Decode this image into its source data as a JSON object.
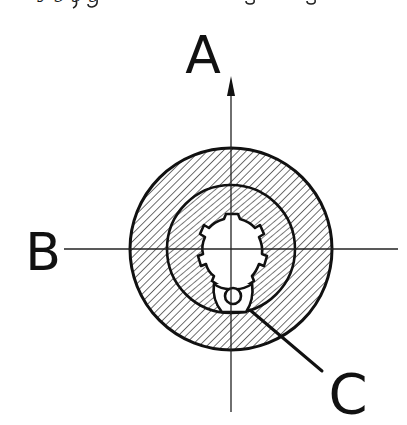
{
  "diagram": {
    "type": "mechanical-cross-section",
    "top_caption_fragment": "y  g                 g g",
    "labels": {
      "a": "A",
      "b": "B",
      "c": "C"
    },
    "axes": {
      "vertical": {
        "label": "A",
        "direction": "up",
        "has_arrow": true
      },
      "horizontal": {
        "label": "B"
      }
    },
    "parts": [
      {
        "name": "outer-ring",
        "hatched": true
      },
      {
        "name": "inner-hub",
        "hatched": true
      },
      {
        "name": "splined-bore",
        "hatched": false
      },
      {
        "name": "pin",
        "label": "C"
      }
    ],
    "colors": {
      "ink": "#111111",
      "background": "#ffffff"
    }
  }
}
